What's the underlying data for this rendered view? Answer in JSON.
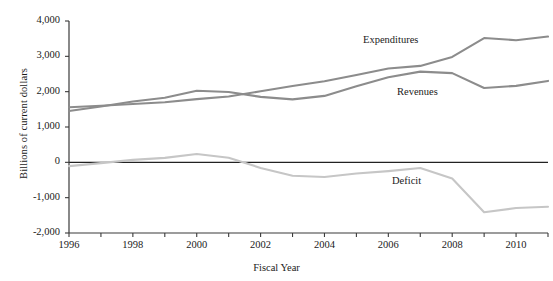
{
  "chart_data": {
    "type": "line",
    "title": "",
    "xlabel": "Fiscal Year",
    "ylabel": "Billions of current dollars",
    "xlim": [
      1996,
      2011
    ],
    "ylim": [
      -2000,
      4000
    ],
    "grid": false,
    "legend_position": "inline-annotations",
    "x": [
      1996,
      1997,
      1998,
      1999,
      2000,
      2001,
      2002,
      2003,
      2004,
      2005,
      2006,
      2007,
      2008,
      2009,
      2010,
      2011
    ],
    "y_ticks": [
      "4,000",
      "3,000",
      "2,000",
      "1,000",
      "0",
      "-1,000",
      "-2,000"
    ],
    "y_tick_values": [
      4000,
      3000,
      2000,
      1000,
      0,
      -1000,
      -2000
    ],
    "x_ticks": [
      "1996",
      "1998",
      "2000",
      "2002",
      "2004",
      "2006",
      "2008",
      "2010"
    ],
    "x_tick_values": [
      1996,
      1998,
      2000,
      2002,
      2004,
      2006,
      2008,
      2010
    ],
    "series": [
      {
        "name": "Expenditures",
        "color": "#8c8c8c",
        "values": [
          1560,
          1601,
          1652,
          1702,
          1789,
          1863,
          2011,
          2160,
          2293,
          2472,
          2655,
          2729,
          2983,
          3518,
          3456,
          3560
        ]
      },
      {
        "name": "Revenues",
        "color": "#8c8c8c",
        "values": [
          1453,
          1579,
          1722,
          1827,
          2025,
          1991,
          1853,
          1782,
          1880,
          2154,
          2407,
          2568,
          2524,
          2105,
          2163,
          2304
        ]
      },
      {
        "name": "Deficit",
        "color": "#c6c6c6",
        "values": [
          -107,
          -22,
          70,
          125,
          236,
          128,
          -158,
          -378,
          -413,
          -318,
          -248,
          -161,
          -459,
          -1413,
          -1293,
          -1256
        ]
      }
    ],
    "annotations": [
      {
        "text": "Expenditures",
        "x_px": 363,
        "y_px": 34
      },
      {
        "text": "Revenues",
        "x_px": 397,
        "y_px": 86
      },
      {
        "text": "Deficit",
        "x_px": 392,
        "y_px": 175
      }
    ]
  }
}
